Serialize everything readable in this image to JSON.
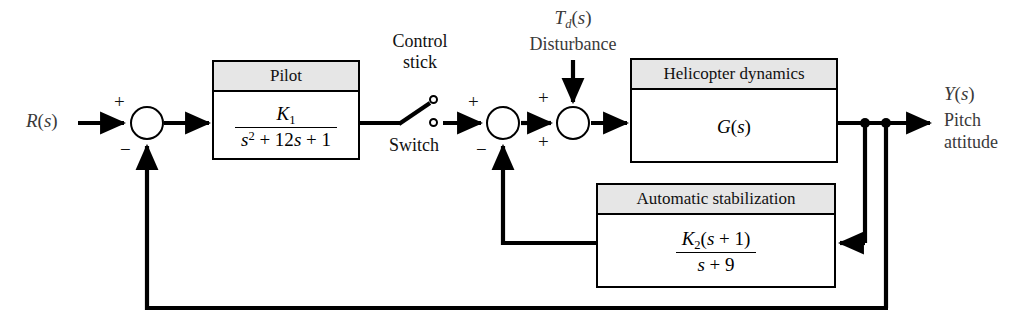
{
  "diagram": {
    "signals": {
      "input": "R(s)",
      "disturbance_symbol": "Td(s)",
      "disturbance_label": "Disturbance",
      "output": "Y(s)",
      "output_label_line1": "Pitch",
      "output_label_line2": "attitude"
    },
    "switch": {
      "label_top_line1": "Control",
      "label_top_line2": "stick",
      "label_bottom": "Switch"
    },
    "blocks": [
      {
        "name": "pilot",
        "header": "Pilot",
        "numerator": "K1",
        "denominator": "s2 + 12s + 1"
      },
      {
        "name": "helicopter-dynamics",
        "header": "Helicopter dynamics",
        "body": "G(s)"
      },
      {
        "name": "automatic-stabilization",
        "header": "Automatic stabilization",
        "numerator": "K2(s + 1)",
        "denominator": "s + 9"
      }
    ],
    "signs": {
      "summer1_plus": "+",
      "summer1_minus": "−",
      "summer2_plus": "+",
      "summer2_minus": "−",
      "summer3_plus_top": "+",
      "summer3_plus_bottom": "+"
    },
    "colors": {
      "line": "#000000",
      "block_header_fill": "#e6e6e6",
      "block_fill": "#ffffff",
      "label_text": "#3a3a3a",
      "background": "#ffffff"
    }
  }
}
